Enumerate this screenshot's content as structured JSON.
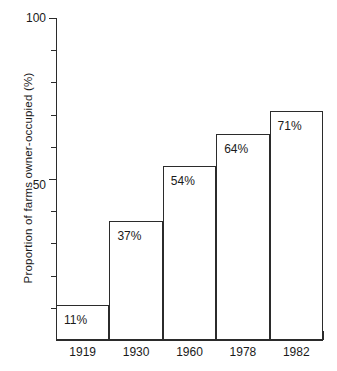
{
  "chart_data": {
    "type": "bar",
    "title": "",
    "subtitle": "",
    "xlabel": "",
    "ylabel": "Proportion of farms owner-occupied (%)",
    "categories": [
      "1919",
      "1930",
      "1960",
      "1978",
      "1982"
    ],
    "values": [
      11,
      37,
      54,
      64,
      71
    ],
    "data_labels": [
      "11%",
      "37%",
      "54%",
      "64%",
      "71%"
    ],
    "ylim": [
      0,
      100
    ],
    "y_tick_values": [
      0,
      10,
      20,
      30,
      40,
      50,
      60,
      70,
      80,
      90,
      100
    ],
    "y_tick_labels_shown": [
      "50",
      "100"
    ],
    "y_tick_label_values": [
      50,
      100
    ],
    "grid": false,
    "legend": false,
    "legend_position": "none",
    "series": [
      {
        "name": "Proportion of farms owner-occupied",
        "values": [
          11,
          37,
          54,
          64,
          71
        ]
      }
    ]
  },
  "axis": {
    "y_title": "Proportion of farms owner-occupied (%)",
    "y_label_top": "100",
    "y_label_mid": "50"
  },
  "bars": [
    {
      "category": "1919",
      "value": 11,
      "label": "11%"
    },
    {
      "category": "1930",
      "value": 37,
      "label": "37%"
    },
    {
      "category": "1960",
      "value": 54,
      "label": "54%"
    },
    {
      "category": "1978",
      "value": 64,
      "label": "64%"
    },
    {
      "category": "1982",
      "value": 71,
      "label": "71%"
    }
  ],
  "colors": {
    "background": "#ffffff",
    "line": "#2b2b2b",
    "text": "#1a1a1a",
    "bar_fill": "#ffffff"
  }
}
